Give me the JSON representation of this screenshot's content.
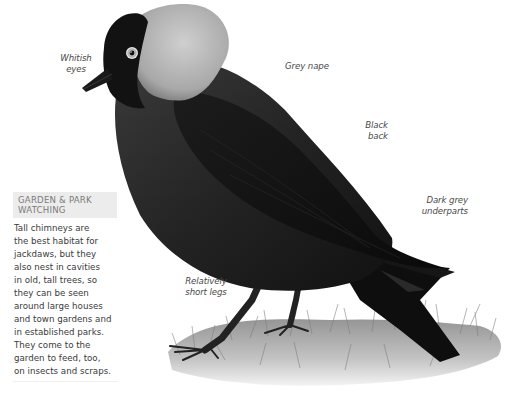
{
  "illustration": {
    "subject": "Jackdaw",
    "colors": {
      "black_plumage": "#141414",
      "dark_grey_plumage": "#2c2c2c",
      "grey_nape": "#b9b9b9",
      "eye_ring": "#e6e6e6",
      "grass": "#9a9a9a"
    }
  },
  "labels": {
    "whitish_eyes": [
      "Whitish",
      "eyes"
    ],
    "grey_nape": "Grey nape",
    "black_back": [
      "Black",
      "back"
    ],
    "dark_grey_underparts": [
      "Dark grey",
      "underparts"
    ],
    "short_legs": [
      "Relatively",
      "short legs"
    ]
  },
  "panel": {
    "heading": [
      "GARDEN & PARK",
      "WATCHING"
    ],
    "body_lines": [
      "Tall chimneys are",
      "the best habitat for",
      "jackdaws, but they",
      "also nest in cavities",
      "in old, tall trees, so",
      "they can be seen",
      "around large houses",
      "and town gardens and",
      "in established parks.",
      "They come to the",
      "garden to feed, too,",
      "on insects and scraps."
    ]
  }
}
